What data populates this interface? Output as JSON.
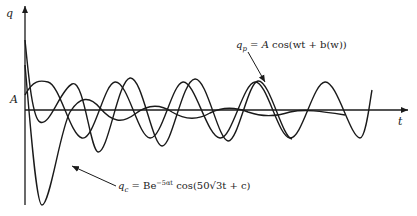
{
  "figure": {
    "axes": {
      "y_label": "q",
      "x_label": "t",
      "amplitude_marker": "A"
    },
    "curves": [
      {
        "name": "steady-state",
        "symbol": "q_p",
        "description": "constant-amplitude sinusoid"
      },
      {
        "name": "transient",
        "symbol": "q_c",
        "description": "exponentially decaying oscillation"
      },
      {
        "name": "total-response",
        "description": "sum of transient and steady-state; converges to q_p"
      }
    ],
    "annotations": {
      "steady_state": {
        "lhs_symbol": "q",
        "lhs_sub": "p",
        "equals": " = ",
        "rhs_A": "A",
        "rhs_rest": " cos(wt + b(w))"
      },
      "transient": {
        "lhs_symbol": "q",
        "lhs_sub": "c",
        "equals": " = ",
        "coef": "Be",
        "exponent": "−5αt",
        "rhs_rest": " cos(50√3t + c)"
      }
    }
  }
}
